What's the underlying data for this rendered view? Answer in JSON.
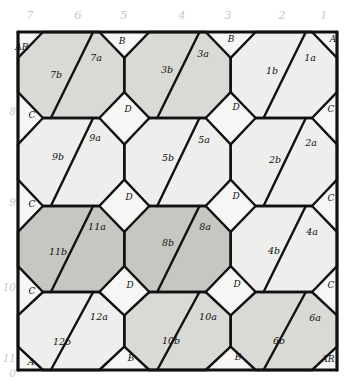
{
  "diagram": {
    "width": 348,
    "height": 387,
    "background": "#ffffff",
    "ink": "#111111",
    "label_color": "#c9c9c9"
  },
  "column_labels": [
    {
      "text": "7",
      "x": 30
    },
    {
      "text": "6",
      "x": 78
    },
    {
      "text": "5",
      "x": 124
    },
    {
      "text": "4",
      "x": 182
    },
    {
      "text": "3",
      "x": 228
    },
    {
      "text": "2",
      "x": 282
    },
    {
      "text": "1",
      "x": 324
    }
  ],
  "row_labels": [
    {
      "text": "8",
      "y": 112
    },
    {
      "text": "9",
      "y": 203
    },
    {
      "text": "10",
      "y": 288
    },
    {
      "text": "11",
      "y": 359
    },
    {
      "text": "0",
      "y": 374
    }
  ],
  "fills": {
    "paper": "#f6f6f4",
    "light": "#eeeeec",
    "medium": "#d9d9d6",
    "dark": "#c6c6c2",
    "white": "#fbfbfa"
  },
  "cells": [
    {
      "id": "7b",
      "label": "7b",
      "shade": "medium",
      "tx": 56,
      "ty": 78
    },
    {
      "id": "7a",
      "label": "7a",
      "shade": "medium",
      "tx": 96,
      "ty": 61
    },
    {
      "id": "3b",
      "label": "3b",
      "shade": "medium",
      "tx": 167,
      "ty": 73
    },
    {
      "id": "3a",
      "label": "3a",
      "shade": "medium",
      "tx": 203,
      "ty": 57
    },
    {
      "id": "1b",
      "label": "1b",
      "shade": "light",
      "tx": 272,
      "ty": 74
    },
    {
      "id": "1a",
      "label": "1a",
      "shade": "light",
      "tx": 310,
      "ty": 61
    },
    {
      "id": "9b",
      "label": "9b",
      "shade": "light",
      "tx": 58,
      "ty": 160
    },
    {
      "id": "9a",
      "label": "9a",
      "shade": "light",
      "tx": 95,
      "ty": 141
    },
    {
      "id": "5b",
      "label": "5b",
      "shade": "light",
      "tx": 168,
      "ty": 161
    },
    {
      "id": "5a",
      "label": "5a",
      "shade": "light",
      "tx": 204,
      "ty": 143
    },
    {
      "id": "2b",
      "label": "2b",
      "shade": "light",
      "tx": 275,
      "ty": 163
    },
    {
      "id": "2a",
      "label": "2a",
      "shade": "light",
      "tx": 311,
      "ty": 146
    },
    {
      "id": "11b",
      "label": "11b",
      "shade": "dark",
      "tx": 58,
      "ty": 255
    },
    {
      "id": "11a",
      "label": "11a",
      "shade": "dark",
      "tx": 97,
      "ty": 230
    },
    {
      "id": "8b",
      "label": "8b",
      "shade": "dark",
      "tx": 168,
      "ty": 246
    },
    {
      "id": "8a",
      "label": "8a",
      "shade": "dark",
      "tx": 205,
      "ty": 230
    },
    {
      "id": "4b",
      "label": "4b",
      "shade": "light",
      "tx": 274,
      "ty": 254
    },
    {
      "id": "4a",
      "label": "4a",
      "shade": "light",
      "tx": 312,
      "ty": 235
    },
    {
      "id": "12b",
      "label": "12b",
      "shade": "light",
      "tx": 62,
      "ty": 345
    },
    {
      "id": "12a",
      "label": "12a",
      "shade": "light",
      "tx": 99,
      "ty": 320
    },
    {
      "id": "10b",
      "label": "10b",
      "shade": "medium",
      "tx": 171,
      "ty": 344
    },
    {
      "id": "10a",
      "label": "10a",
      "shade": "medium",
      "tx": 208,
      "ty": 320
    },
    {
      "id": "6b",
      "label": "6b",
      "shade": "medium",
      "tx": 279,
      "ty": 344
    },
    {
      "id": "6a",
      "label": "6a",
      "shade": "medium",
      "tx": 315,
      "ty": 321
    }
  ],
  "edge_markers": [
    {
      "label": "AR",
      "x": 22,
      "y": 50
    },
    {
      "label": "B",
      "x": 122,
      "y": 44
    },
    {
      "label": "B",
      "x": 231,
      "y": 42
    },
    {
      "label": "A",
      "x": 333,
      "y": 42
    },
    {
      "label": "C",
      "x": 32,
      "y": 118
    },
    {
      "label": "D",
      "x": 128,
      "y": 112
    },
    {
      "label": "D",
      "x": 236,
      "y": 110
    },
    {
      "label": "C",
      "x": 331,
      "y": 112
    },
    {
      "label": "C",
      "x": 32,
      "y": 207
    },
    {
      "label": "D",
      "x": 129,
      "y": 200
    },
    {
      "label": "D",
      "x": 236,
      "y": 199
    },
    {
      "label": "C",
      "x": 331,
      "y": 201
    },
    {
      "label": "C",
      "x": 32,
      "y": 294
    },
    {
      "label": "D",
      "x": 130,
      "y": 288
    },
    {
      "label": "D",
      "x": 237,
      "y": 287
    },
    {
      "label": "C",
      "x": 331,
      "y": 288
    },
    {
      "label": "A",
      "x": 31,
      "y": 365
    },
    {
      "label": "B",
      "x": 131,
      "y": 361
    },
    {
      "label": "B",
      "x": 238,
      "y": 360
    },
    {
      "label": "AR",
      "x": 328,
      "y": 362
    }
  ]
}
